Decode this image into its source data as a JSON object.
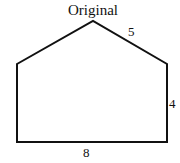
{
  "diagram": {
    "title": "Original",
    "shape": "pentagon (house shape)",
    "vertices": [
      [
        17,
        64
      ],
      [
        93,
        21
      ],
      [
        167,
        64
      ],
      [
        167,
        142
      ],
      [
        17,
        142
      ]
    ],
    "labels": {
      "slant_side": "5",
      "right_side": "4",
      "bottom_side": "8"
    },
    "stroke_color": "#111111"
  }
}
